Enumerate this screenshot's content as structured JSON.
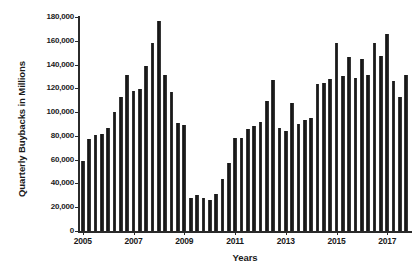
{
  "chart_data": {
    "type": "bar",
    "title": "",
    "xlabel": "Years",
    "ylabel": "Quarterly Buybacks in Millions",
    "ylim": [
      0,
      180000
    ],
    "grid": false,
    "legend": null,
    "y_ticks": [
      0,
      20000,
      40000,
      60000,
      80000,
      100000,
      120000,
      140000,
      160000,
      180000
    ],
    "y_tick_labels": [
      "0",
      "20,000",
      "40,000",
      "60,000",
      "80,000",
      "100,000",
      "120,000",
      "140,000",
      "160,000",
      "180,000"
    ],
    "x_tick_labels": [
      "2005",
      "2007",
      "2009",
      "2011",
      "2013",
      "2015",
      "2017"
    ],
    "x_tick_categories": [
      "2005Q1",
      "2007Q1",
      "2009Q1",
      "2011Q1",
      "2013Q1",
      "2015Q1",
      "2017Q1"
    ],
    "bar_color": "#2a2a2a",
    "categories": [
      "2005Q1",
      "2005Q2",
      "2005Q3",
      "2005Q4",
      "2006Q1",
      "2006Q2",
      "2006Q3",
      "2006Q4",
      "2007Q1",
      "2007Q2",
      "2007Q3",
      "2007Q4",
      "2008Q1",
      "2008Q2",
      "2008Q3",
      "2008Q4",
      "2009Q1",
      "2009Q2",
      "2009Q3",
      "2009Q4",
      "2010Q1",
      "2010Q2",
      "2010Q3",
      "2010Q4",
      "2011Q1",
      "2011Q2",
      "2011Q3",
      "2011Q4",
      "2012Q1",
      "2012Q2",
      "2012Q3",
      "2012Q4",
      "2013Q1",
      "2013Q2",
      "2013Q3",
      "2013Q4",
      "2014Q1",
      "2014Q2",
      "2014Q3",
      "2014Q4",
      "2015Q1",
      "2015Q2",
      "2015Q3",
      "2015Q4",
      "2016Q1",
      "2016Q2",
      "2016Q3",
      "2016Q4",
      "2017Q1",
      "2017Q2",
      "2017Q3",
      "2017Q4"
    ],
    "values": [
      59000,
      77000,
      80500,
      82000,
      87000,
      100000,
      112500,
      131000,
      117500,
      119500,
      139000,
      158500,
      176500,
      131000,
      117000,
      91000,
      89000,
      28000,
      30000,
      27500,
      26500,
      31000,
      44000,
      57000,
      78000,
      78000,
      85500,
      88500,
      92000,
      109500,
      127000,
      86500,
      84000,
      108000,
      90000,
      93500,
      95000,
      124000,
      124500,
      128000,
      158500,
      130000,
      146500,
      128500,
      145000,
      131500,
      158000,
      147000,
      165500,
      126500,
      112500,
      131500
    ],
    "units": "Millions"
  }
}
